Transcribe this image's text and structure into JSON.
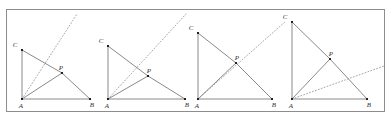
{
  "figure": {
    "canvas": {
      "width": 391,
      "height": 121
    },
    "frame": {
      "x": 6,
      "y": 9,
      "width": 379,
      "height": 103,
      "stroke": "#8d8d8d"
    },
    "colors": {
      "background": "#ffffff",
      "frame_stroke": "#8d8d8d",
      "solid_line": "#8a8a8a",
      "dotted_line": "#a8a8a8",
      "vertex_dot": "#1f1f1f",
      "label_text": "#333333"
    },
    "panels": [
      {
        "name": "panel-1",
        "points": {
          "A": {
            "x": 22,
            "y": 99,
            "label": "A",
            "label_dx": -1,
            "label_dy": 9
          },
          "B": {
            "x": 90,
            "y": 99,
            "label": "B",
            "label_dx": 2,
            "label_dy": 8
          },
          "C": {
            "x": 22,
            "y": 50,
            "label": "C",
            "label_dx": -7,
            "label_dy": -3
          },
          "P": {
            "x": 62,
            "y": 73,
            "label": "P",
            "label_dx": -1,
            "label_dy": -3
          }
        },
        "segments": [
          {
            "name": "side-AC",
            "from": "A",
            "to": "C"
          },
          {
            "name": "side-AB",
            "from": "A",
            "to": "B"
          },
          {
            "name": "segment-CP",
            "from": "C",
            "to": "P"
          },
          {
            "name": "segment-AP",
            "from": "A",
            "to": "P"
          },
          {
            "name": "segment-PB",
            "from": "P",
            "to": "B"
          }
        ],
        "dotted_ray": {
          "name": "dotted-ray-from-A",
          "from": "A",
          "to": {
            "x": 77,
            "y": 14
          }
        }
      },
      {
        "name": "panel-2",
        "points": {
          "A": {
            "x": 108,
            "y": 99,
            "label": "A",
            "label_dx": -1,
            "label_dy": 9
          },
          "B": {
            "x": 185,
            "y": 99,
            "label": "B",
            "label_dx": 2,
            "label_dy": 8
          },
          "C": {
            "x": 108,
            "y": 46,
            "label": "C",
            "label_dx": -7,
            "label_dy": -3
          },
          "P": {
            "x": 148,
            "y": 76,
            "label": "P",
            "label_dx": 1,
            "label_dy": -3
          }
        },
        "segments": [
          {
            "name": "side-AC",
            "from": "A",
            "to": "C"
          },
          {
            "name": "side-AB",
            "from": "A",
            "to": "B"
          },
          {
            "name": "segment-CP",
            "from": "C",
            "to": "P"
          },
          {
            "name": "segment-AP",
            "from": "A",
            "to": "P"
          },
          {
            "name": "segment-PB",
            "from": "P",
            "to": "B"
          }
        ],
        "dotted_ray": {
          "name": "dotted-ray-from-A",
          "from": "A",
          "to": {
            "x": 186,
            "y": 14
          }
        }
      },
      {
        "name": "panel-3",
        "points": {
          "A": {
            "x": 198,
            "y": 99,
            "label": "A",
            "label_dx": -1,
            "label_dy": 9
          },
          "B": {
            "x": 272,
            "y": 99,
            "label": "B",
            "label_dx": 2,
            "label_dy": 8
          },
          "C": {
            "x": 198,
            "y": 33,
            "label": "C",
            "label_dx": -7,
            "label_dy": -3
          },
          "P": {
            "x": 236,
            "y": 63,
            "label": "P",
            "label_dx": 1,
            "label_dy": -3
          }
        },
        "segments": [
          {
            "name": "side-AC",
            "from": "A",
            "to": "C"
          },
          {
            "name": "side-AB",
            "from": "A",
            "to": "B"
          },
          {
            "name": "segment-CP",
            "from": "C",
            "to": "P"
          },
          {
            "name": "segment-AP",
            "from": "A",
            "to": "P"
          },
          {
            "name": "segment-PB",
            "from": "P",
            "to": "B"
          }
        ],
        "dotted_ray": {
          "name": "dotted-ray-from-A",
          "from": "A",
          "to": {
            "x": 286,
            "y": 21
          }
        }
      },
      {
        "name": "panel-4",
        "points": {
          "A": {
            "x": 292,
            "y": 99,
            "label": "A",
            "label_dx": -1,
            "label_dy": 9
          },
          "B": {
            "x": 367,
            "y": 99,
            "label": "B",
            "label_dx": 2,
            "label_dy": 8
          },
          "C": {
            "x": 292,
            "y": 22,
            "label": "C",
            "label_dx": -7,
            "label_dy": -3
          },
          "P": {
            "x": 330,
            "y": 59,
            "label": "P",
            "label_dx": 1,
            "label_dy": -3
          }
        },
        "segments": [
          {
            "name": "side-AC",
            "from": "A",
            "to": "C"
          },
          {
            "name": "side-AB",
            "from": "A",
            "to": "B"
          },
          {
            "name": "segment-CP",
            "from": "C",
            "to": "P"
          },
          {
            "name": "segment-AP",
            "from": "A",
            "to": "P"
          },
          {
            "name": "segment-PB",
            "from": "P",
            "to": "B"
          }
        ],
        "dotted_ray": {
          "name": "dotted-ray-from-A",
          "from": "A",
          "to": {
            "x": 384,
            "y": 66
          }
        }
      }
    ]
  }
}
